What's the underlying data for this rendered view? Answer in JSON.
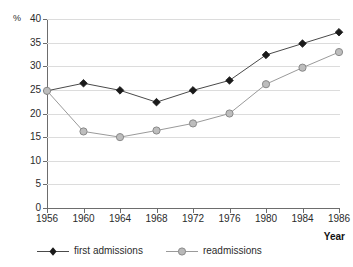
{
  "chart_data": {
    "type": "line",
    "title": "",
    "subtitle": "",
    "xlabel": "Year",
    "ylabel": "%",
    "x": [
      1956,
      1960,
      1964,
      1968,
      1972,
      1976,
      1980,
      1984,
      1986
    ],
    "categories": [
      "1956",
      "1960",
      "1964",
      "1968",
      "1972",
      "1976",
      "1980",
      "1984",
      "1986"
    ],
    "series": [
      {
        "name": "first admissions",
        "marker": "diamond",
        "color": "#1a1a1a",
        "values": [
          24.8,
          26.4,
          24.9,
          22.4,
          24.9,
          27.0,
          32.4,
          34.8,
          37.2
        ]
      },
      {
        "name": "readmissions",
        "marker": "circle",
        "color": "#b3b3b3",
        "values": [
          24.8,
          16.2,
          15.0,
          16.4,
          17.9,
          20.0,
          26.2,
          29.7,
          33.0
        ]
      }
    ],
    "ylim": [
      0,
      40
    ],
    "yticks": [
      0,
      5,
      10,
      15,
      20,
      25,
      30,
      35,
      40
    ],
    "ytick_labels": [
      "0",
      "5",
      "10",
      "15",
      "20",
      "25",
      "30",
      "35",
      "40"
    ],
    "xtick_labels": [
      "1956",
      "1960",
      "1964",
      "1968",
      "1972",
      "1976",
      "1980",
      "1984",
      "1986"
    ],
    "grid": true,
    "grid_axis": "y",
    "legend_position": "bottom-left",
    "legend_entries": [
      "first admissions",
      "readmissions"
    ],
    "annotations": []
  },
  "colors": {
    "background": "#ffffff",
    "axis": "#6d6d6d",
    "gridline": "#dcdcdc",
    "text": "#2b2b2b",
    "first_admissions": "#1a1a1a",
    "readmissions": "#b3b3b3",
    "readmissions_edge": "#8a8a8a",
    "line_gray": "#6f6f6f"
  }
}
